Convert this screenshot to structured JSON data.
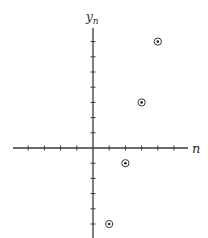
{
  "chart_data": {
    "type": "scatter",
    "title": "",
    "xlabel": "n",
    "ylabel": "y",
    "ylabel_subscript": "n",
    "x": [
      1,
      2,
      3,
      4
    ],
    "y": [
      -5,
      -1,
      3,
      7
    ],
    "series": [
      {
        "name": "y_n",
        "points": [
          {
            "n": 1,
            "y": -5
          },
          {
            "n": 2,
            "y": -1
          },
          {
            "n": 3,
            "y": 3
          },
          {
            "n": 4,
            "y": 7
          }
        ]
      }
    ],
    "marker": "circled-dot",
    "xlim": [
      -5,
      6
    ],
    "ylim": [
      -6,
      8
    ],
    "x_ticks": [
      -4,
      -3,
      -2,
      -1,
      1,
      2,
      3,
      4,
      5
    ],
    "y_ticks": [
      -5,
      -4,
      -3,
      -2,
      -1,
      1,
      2,
      3,
      4,
      5,
      6,
      7
    ],
    "tick_labels_shown": false,
    "grid": false,
    "legend": null
  },
  "layout": {
    "origin_px": [
      93,
      148
    ],
    "x_unit_px": 16.2,
    "y_unit_px": 15.2,
    "x_axis_px": [
      13,
      188
    ],
    "y_axis_px": [
      28,
      238
    ]
  },
  "colors": {
    "axis": "#3a3a3a",
    "marker": "#222222",
    "background": "#ffffff"
  }
}
